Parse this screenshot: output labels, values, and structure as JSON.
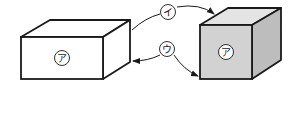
{
  "diagram": {
    "left_box": {
      "label": "ア",
      "fill": "#ffffff"
    },
    "right_cube": {
      "label": "ア",
      "front_fill": "#d2d2d2",
      "top_fill": "#e4e4e4",
      "side_fill": "#bdbdbd"
    },
    "arrow_top": {
      "label": "イ"
    },
    "arrow_bottom": {
      "label": "ウ"
    },
    "stroke_color": "#1a1a1a"
  }
}
